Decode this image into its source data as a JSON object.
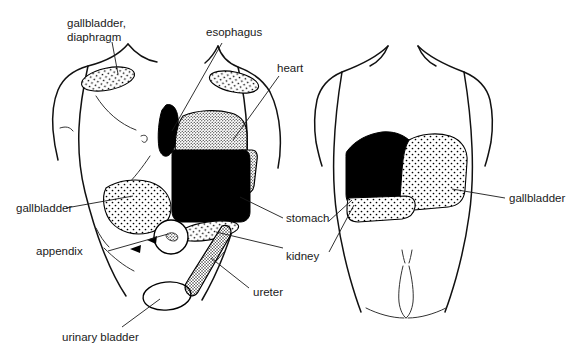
{
  "figure": {
    "background_color": "#ffffff",
    "ink_color": "#000000",
    "width": 570,
    "height": 360
  },
  "views": [
    {
      "id": "anterior",
      "name": "anterior-torso-view"
    },
    {
      "id": "posterior",
      "name": "posterior-torso-view"
    }
  ],
  "labels": {
    "gallbladder_diaphragm_line1": "gallbladder,",
    "gallbladder_diaphragm_line2": "diaphragm",
    "esophagus": "esophagus",
    "heart": "heart",
    "gallbladder_anterior": "gallbladder",
    "appendix": "appendix",
    "urinary_bladder": "urinary bladder",
    "stomach": "stomach",
    "kidney": "kidney",
    "ureter": "ureter",
    "gallbladder_posterior": "gallbladder"
  },
  "regions": [
    {
      "name": "gallbladder-diaphragm-shoulder-patch-left",
      "fill": "stipple",
      "view": "anterior"
    },
    {
      "name": "gallbladder-diaphragm-shoulder-patch-right",
      "fill": "stipple",
      "view": "anterior"
    },
    {
      "name": "esophagus-region",
      "fill": "solid",
      "view": "anterior"
    },
    {
      "name": "heart-region",
      "fill": "dense-stipple",
      "view": "anterior"
    },
    {
      "name": "stomach-region",
      "fill": "solid",
      "view": "anterior"
    },
    {
      "name": "gallbladder-region",
      "fill": "stipple",
      "view": "anterior"
    },
    {
      "name": "kidney-region",
      "fill": "stipple",
      "view": "anterior"
    },
    {
      "name": "ureter-region",
      "fill": "dense-stipple",
      "view": "anterior"
    },
    {
      "name": "appendix-region",
      "fill": "stipple-circle",
      "view": "anterior"
    },
    {
      "name": "urinary-bladder-region",
      "fill": "outline-ellipse",
      "view": "anterior"
    },
    {
      "name": "stomach-region-posterior",
      "fill": "solid",
      "view": "posterior"
    },
    {
      "name": "gallbladder-region-posterior",
      "fill": "stipple",
      "view": "posterior"
    },
    {
      "name": "kidney-region-posterior",
      "fill": "stipple",
      "view": "posterior"
    }
  ]
}
